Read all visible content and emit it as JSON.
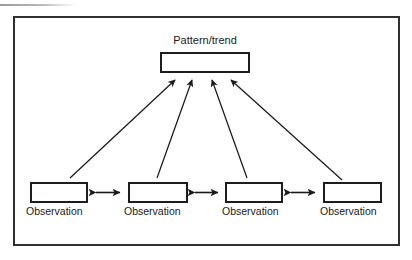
{
  "figure": {
    "type": "concept-diagram",
    "colors": {
      "frame_stroke": "#303030",
      "box_stroke": "#1d1d1d",
      "arrow_stroke": "#1a1a1a",
      "text": "#1a1a1a",
      "background": "#ffffff",
      "artifact": "#969696"
    }
  },
  "pattern_node": {
    "label": "Pattern/trend",
    "box_text": ""
  },
  "observation_nodes": [
    {
      "label": "Observation",
      "box_text": ""
    },
    {
      "label": "Observation",
      "box_text": ""
    },
    {
      "label": "Observation",
      "box_text": ""
    },
    {
      "label": "Observation",
      "box_text": ""
    }
  ],
  "connectors": {
    "converging_arrows": {
      "count": 4,
      "direction": "upward-to-pattern",
      "arrowhead": "single"
    },
    "lateral_arrows": {
      "count": 3,
      "direction": "bidirectional",
      "arrowhead": "double"
    }
  }
}
